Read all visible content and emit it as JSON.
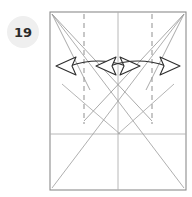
{
  "step": {
    "badge_label": "19",
    "badge_bg": "#efefef",
    "badge_text_color": "#2b2b2b"
  },
  "diagram": {
    "paper": {
      "x": 50,
      "y": 12,
      "width": 136,
      "height": 178,
      "stroke": "#8c8c8c",
      "fill": "#ffffff",
      "stroke_width": 1.1
    },
    "colors": {
      "edge": "#8c8c8c",
      "crease_valley": "#9a9a9a",
      "crease_mountain": "#b0b0b0",
      "dashed_guide": "#9a9a9a",
      "arrow_stroke": "#2e2e2e",
      "arrow_fill": "#ffffff"
    },
    "crease_lines": [
      {
        "name": "vertical-center-crease",
        "x1": 118,
        "y1": 12,
        "x2": 118,
        "y2": 190,
        "style": "solid",
        "color": "#b0b0b0",
        "width": 0.9
      },
      {
        "name": "horizontal-mid-crease",
        "x1": 50,
        "y1": 134,
        "x2": 186,
        "y2": 134,
        "style": "solid",
        "color": "#b0b0b0",
        "width": 0.9
      },
      {
        "name": "diagonal-topleft-to-bottomright",
        "x1": 52,
        "y1": 14,
        "x2": 184,
        "y2": 188,
        "style": "solid",
        "color": "#a6a6a6",
        "width": 0.9
      },
      {
        "name": "diagonal-topright-to-bottomleft",
        "x1": 184,
        "y1": 14,
        "x2": 52,
        "y2": 188,
        "style": "solid",
        "color": "#a6a6a6",
        "width": 0.9
      },
      {
        "name": "crease-left-corner-to-lower-right",
        "x1": 52,
        "y1": 14,
        "x2": 152,
        "y2": 121,
        "style": "solid",
        "color": "#9a9a9a",
        "width": 0.85
      },
      {
        "name": "crease-right-corner-to-lower-left",
        "x1": 184,
        "y1": 14,
        "x2": 84,
        "y2": 121,
        "style": "solid",
        "color": "#9a9a9a",
        "width": 0.85
      },
      {
        "name": "crease-left-short-to-apex",
        "x1": 52,
        "y1": 14,
        "x2": 86,
        "y2": 82,
        "style": "solid",
        "color": "#9a9a9a",
        "width": 0.85
      },
      {
        "name": "crease-right-short-to-apex",
        "x1": 184,
        "y1": 14,
        "x2": 150,
        "y2": 82,
        "style": "solid",
        "color": "#9a9a9a",
        "width": 0.85
      },
      {
        "name": "crease-left-mid-diagonal",
        "x1": 62,
        "y1": 84,
        "x2": 120,
        "y2": 134,
        "style": "solid",
        "color": "#a6a6a6",
        "width": 0.85
      },
      {
        "name": "crease-right-mid-diagonal",
        "x1": 174,
        "y1": 84,
        "x2": 118,
        "y2": 134,
        "style": "solid",
        "color": "#a6a6a6",
        "width": 0.85
      }
    ],
    "dashed_guides": [
      {
        "name": "dashed-guide-left",
        "x1": 84,
        "y1": 14,
        "x2": 84,
        "y2": 124,
        "dash": "5,4",
        "color": "#9a9a9a",
        "width": 1.1
      },
      {
        "name": "dashed-guide-right",
        "x1": 152,
        "y1": 14,
        "x2": 152,
        "y2": 124,
        "dash": "5,4",
        "color": "#9a9a9a",
        "width": 1.1
      }
    ],
    "arrows": [
      {
        "name": "fold-arrow-left-pair",
        "description": "double-headed curved arrow, heads point outward-left and inward-right",
        "curve": "M 66,66 Q 100,56 130,66",
        "head_left": {
          "points": "66,66 82,58 80,66 82,74",
          "rotate": 0
        },
        "head_right": {
          "points": "130,66 114,58 116,66 114,74",
          "rotate": 0
        }
      },
      {
        "name": "fold-arrow-right-pair",
        "description": "mirrored double-headed curved arrow",
        "curve": "M 170,66 Q 136,56 106,66",
        "head_right": {
          "points": "170,66 154,58 156,66 154,74",
          "rotate": 0
        },
        "head_left": {
          "points": "106,66 122,58 120,66 122,74",
          "rotate": 0
        }
      }
    ]
  }
}
